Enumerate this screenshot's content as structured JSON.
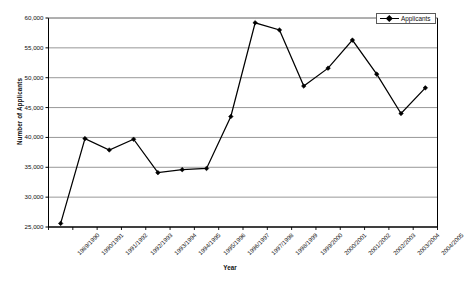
{
  "chart_data": {
    "type": "line",
    "title": "",
    "xlabel": "Year",
    "ylabel": "Number of Applicants",
    "ylim": [
      25000,
      60000
    ],
    "ytick_step": 5000,
    "grid": true,
    "legend_position": "top-right",
    "categories": [
      "1989/1990",
      "1990/1991",
      "1991/1992",
      "1992/1993",
      "1993/1994",
      "1994/1995",
      "1995/1996",
      "1996/1997",
      "1997/1998",
      "1998/1999",
      "1999/2000",
      "2000/2001",
      "2001/2002",
      "2002/2003",
      "2003/2004",
      "2004/2005"
    ],
    "ytick_labels": [
      "60,000",
      "55,000",
      "50,000",
      "45,000",
      "40,000",
      "35,000",
      "30,000",
      "25,000"
    ],
    "ytick_values": [
      60000,
      55000,
      50000,
      45000,
      40000,
      35000,
      30000,
      25000
    ],
    "series": [
      {
        "name": "Applicants",
        "color": "#000000",
        "marker": "diamond",
        "values": [
          25600,
          39800,
          37900,
          39700,
          34100,
          34600,
          34800,
          43500,
          59200,
          58000,
          48600,
          51600,
          56300,
          50600,
          44000,
          48300
        ]
      }
    ]
  },
  "legend": {
    "entries": [
      {
        "label": "Applicants"
      }
    ]
  }
}
